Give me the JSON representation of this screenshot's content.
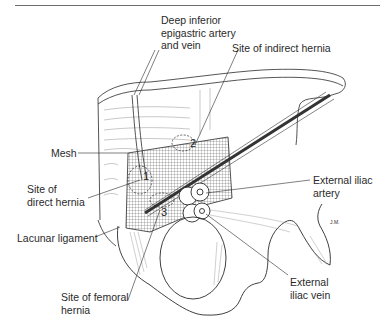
{
  "figure": {
    "type": "anatomical-illustration",
    "colors": {
      "line": "#2a2a2a",
      "mesh": "#555555",
      "background": "#ffffff",
      "rule": "#6e6e6e"
    }
  },
  "labels": {
    "deep_inferior_epigastric": "Deep inferior\nepigastric artery\nand vein",
    "indirect_hernia": "Site of indirect hernia",
    "mesh": "Mesh",
    "direct_hernia": "Site of\ndirect hernia",
    "external_iliac_artery": "External iliac\nartery",
    "lacunar_ligament": "Lacunar ligament",
    "femoral_hernia": "Site of femoral\nhernia",
    "external_iliac_vein": "External\niliac vein"
  },
  "markers": {
    "one": "1",
    "two": "2",
    "three": "3",
    "artist_signature": "J.M."
  }
}
